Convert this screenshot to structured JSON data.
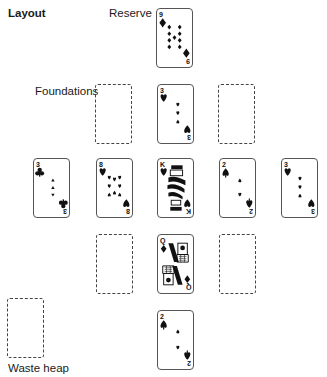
{
  "labels": {
    "layout": "Layout",
    "reserve": "Reserve",
    "foundations": "Foundations",
    "waste_heap": "Waste heap"
  },
  "reserve": {
    "rank": "9",
    "suit": "diamonds",
    "suit_icon": "diamond-icon"
  },
  "foundations": [
    {
      "empty": true
    },
    {
      "rank": "3",
      "suit": "hearts",
      "suit_icon": "heart-icon"
    },
    {
      "empty": true
    }
  ],
  "tableau": [
    {
      "rank": "3",
      "suit": "clubs",
      "suit_icon": "club-icon"
    },
    {
      "rank": "8",
      "suit": "hearts",
      "suit_icon": "heart-icon"
    },
    {
      "rank": "K",
      "suit": "hearts",
      "suit_icon": "heart-icon",
      "face": "king"
    },
    {
      "rank": "2",
      "suit": "spades",
      "suit_icon": "spade-icon"
    },
    {
      "rank": "3",
      "suit": "hearts",
      "suit_icon": "heart-icon"
    }
  ],
  "row4": [
    {
      "empty": true
    },
    {
      "rank": "Q",
      "suit": "diamonds",
      "suit_icon": "diamond-icon",
      "face": "queen"
    },
    {
      "empty": true
    }
  ],
  "waste_heap": {
    "empty": true
  },
  "stock_card": {
    "rank": "2",
    "suit": "spades",
    "suit_icon": "spade-icon"
  }
}
